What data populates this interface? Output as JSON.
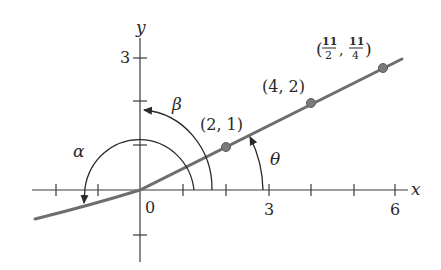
{
  "diagram": {
    "axes": {
      "x_label": "x",
      "y_label": "y",
      "origin_label": "0",
      "x_tick_labels": [
        {
          "value": 3,
          "label": "3"
        },
        {
          "value": 6,
          "label": "6"
        }
      ],
      "y_tick_labels": [
        {
          "value": 3,
          "label": "3"
        }
      ],
      "x_ticks": [
        -2,
        -1,
        1,
        2,
        3,
        4,
        5,
        6
      ],
      "y_ticks": [
        -1,
        1,
        2,
        3
      ]
    },
    "angles": {
      "alpha": "α",
      "beta": "β",
      "theta": "θ"
    },
    "points": [
      {
        "x": 2,
        "y": 1,
        "label": "(2, 1)"
      },
      {
        "x": 4,
        "y": 2,
        "label": "(4, 2)"
      },
      {
        "x": 5.5,
        "y": 2.75,
        "label_open": "(",
        "x_num": "11",
        "x_den": "2",
        "sep": ",",
        "y_num": "11",
        "y_den": "4",
        "label_close": ")"
      }
    ],
    "line": {
      "slope": 0.5,
      "description": "ray y = x/2 through origin, curving down into third quadrant"
    },
    "colors": {
      "curve": "#6e6e6e",
      "point": "#7a7a7a",
      "axis": "#3a3a3a",
      "text": "#2a2a2a"
    }
  }
}
